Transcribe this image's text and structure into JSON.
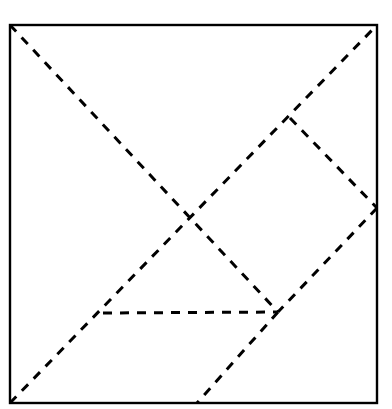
{
  "figure": {
    "kind": "geometry-construction-diagram",
    "canvas": {
      "width": 392,
      "height": 409,
      "background": "#ffffff"
    },
    "colors": {
      "background": "#ffffff",
      "outline": "#000000",
      "construction_line": "#000000"
    },
    "square": {
      "label": "outer-square",
      "x": 10,
      "y": 25,
      "width": 367,
      "height": 378,
      "stroke": "#000000",
      "stroke_width": 2.4,
      "fill": "none"
    },
    "points": {
      "top_left": [
        10,
        25
      ],
      "top_right": [
        377,
        25
      ],
      "bottom_left": [
        10,
        403
      ],
      "bottom_right": [
        377,
        403
      ],
      "center_cross": [
        188,
        215
      ],
      "diamond_apex": [
        290,
        118
      ],
      "right_edge_node": [
        377,
        208
      ],
      "lower_node": [
        278,
        312
      ],
      "left_node": [
        103,
        313
      ],
      "bottom_edge_node": [
        197,
        403
      ]
    },
    "dash": {
      "pattern": "9 8",
      "stroke_width": 3,
      "linecap": "butt",
      "stroke": "#000000"
    },
    "lines": [
      {
        "name": "diagonal-top-left-to-lower-node",
        "from": [
          10,
          25
        ],
        "to": [
          278,
          312
        ],
        "style": "dashed"
      },
      {
        "name": "diagonal-bottom-left-to-top-right",
        "from": [
          10,
          403
        ],
        "to": [
          377,
          25
        ],
        "style": "dashed"
      },
      {
        "name": "diamond-upper-right-edge",
        "from": [
          290,
          118
        ],
        "to": [
          377,
          208
        ],
        "style": "dashed"
      },
      {
        "name": "diamond-lower-right-edge",
        "from": [
          377,
          208
        ],
        "to": [
          278,
          312
        ],
        "style": "dashed"
      },
      {
        "name": "diagonal-lower-node-to-bottom-edge",
        "from": [
          278,
          312
        ],
        "to": [
          197,
          403
        ],
        "style": "dashed"
      },
      {
        "name": "horizontal-chord",
        "from": [
          103,
          313
        ],
        "to": [
          278,
          312
        ],
        "style": "dashed"
      }
    ]
  }
}
